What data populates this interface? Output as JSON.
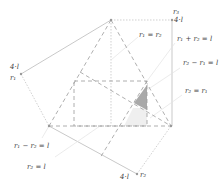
{
  "diagram": {
    "labels": {
      "r3_axis": "r₃",
      "top_4l": "4·l",
      "left_4l": "4·l",
      "left_r1": "r₁",
      "bottom_4l": "4·l",
      "bottom_r2": "r₂",
      "eq_r1_r2": "r₁ = r₂",
      "eq_r1_plus_r2": "r₁ + r₂ = l",
      "eq_r2_minus_r1": "r₂ − r₁ = l",
      "eq_r2_r1": "r₂ = r₁",
      "eq_r1_minus_r2": "r₁ − r₂ = l",
      "eq_r2_l": "r₂ = l"
    },
    "colors": {
      "line": "#b8b8b8",
      "dashed": "#9a9a9a",
      "shade_dark": "#a8a8a8",
      "shade_light": "#ececec"
    }
  }
}
